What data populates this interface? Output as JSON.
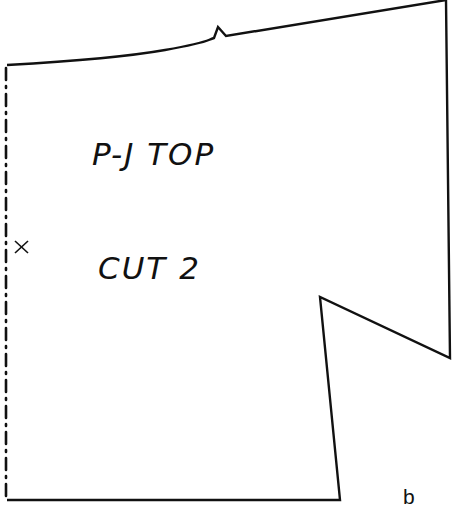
{
  "diagram": {
    "type": "sewing-pattern-piece",
    "piece_name": "P-J TOP",
    "cut_instruction": "CUT 2",
    "figure_label": "b",
    "fold_mark": "×",
    "features": {
      "fold_line": "dash-dot line along left edge",
      "notch": "single triangular notch on top (shoulder) edge",
      "underarm_cutout": "angled notch cut into right side"
    },
    "colors": {
      "line": "#111111",
      "background": "#ffffff"
    }
  }
}
